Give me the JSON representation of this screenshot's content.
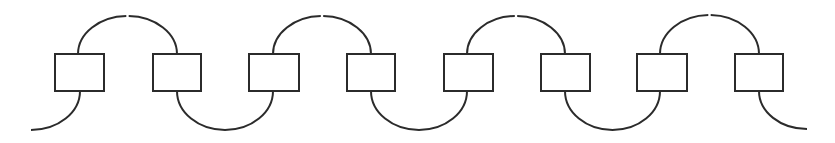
{
  "diagram": {
    "title": "",
    "background": "#ffffff",
    "stroke_color": "#2b2b2b",
    "stroke_width": 2,
    "canvas": {
      "width": 835,
      "height": 143
    },
    "nodes": [
      {
        "id": "box-1",
        "x": 55,
        "y": 54,
        "w": 49,
        "h": 37,
        "label": ""
      },
      {
        "id": "box-2",
        "x": 153,
        "y": 54,
        "w": 48,
        "h": 37,
        "label": ""
      },
      {
        "id": "box-3",
        "x": 249,
        "y": 54,
        "w": 50,
        "h": 37,
        "label": ""
      },
      {
        "id": "box-4",
        "x": 347,
        "y": 54,
        "w": 48,
        "h": 37,
        "label": ""
      },
      {
        "id": "box-5",
        "x": 444,
        "y": 54,
        "w": 49,
        "h": 37,
        "label": ""
      },
      {
        "id": "box-6",
        "x": 541,
        "y": 54,
        "w": 49,
        "h": 37,
        "label": ""
      },
      {
        "id": "box-7",
        "x": 637,
        "y": 54,
        "w": 50,
        "h": 37,
        "label": ""
      },
      {
        "id": "box-8",
        "x": 735,
        "y": 54,
        "w": 48,
        "h": 37,
        "label": ""
      }
    ],
    "top_arcs": [
      {
        "id": "top-arc-1",
        "from": "box-1",
        "to": "box-2",
        "x1": 78,
        "x2": 177,
        "peak_y": 16,
        "gap_x": 127
      },
      {
        "id": "top-arc-2",
        "from": "box-3",
        "to": "box-4",
        "x1": 273,
        "x2": 371,
        "peak_y": 16,
        "gap_x": 322
      },
      {
        "id": "top-arc-3",
        "from": "box-5",
        "to": "box-6",
        "x1": 467,
        "x2": 565,
        "peak_y": 16,
        "gap_x": 515
      },
      {
        "id": "top-arc-4",
        "from": "box-7",
        "to": "box-8",
        "x1": 660,
        "x2": 759,
        "peak_y": 15,
        "gap_x": 709
      }
    ],
    "bottom_arcs": [
      {
        "id": "bottom-arc-1",
        "from": "box-2",
        "to": "box-3",
        "x1": 177,
        "x2": 273,
        "low_y": 130
      },
      {
        "id": "bottom-arc-2",
        "from": "box-4",
        "to": "box-5",
        "x1": 371,
        "x2": 467,
        "low_y": 130
      },
      {
        "id": "bottom-arc-3",
        "from": "box-6",
        "to": "box-7",
        "x1": 565,
        "x2": 660,
        "low_y": 130
      }
    ],
    "tails": [
      {
        "id": "left-tail",
        "from": "box-1",
        "x_start": 80,
        "y_start": 91,
        "x_end": 31,
        "y_end": 130
      },
      {
        "id": "right-tail",
        "from": "box-8",
        "x_start": 759,
        "y_start": 91,
        "x_end": 807,
        "y_end": 129
      }
    ]
  }
}
